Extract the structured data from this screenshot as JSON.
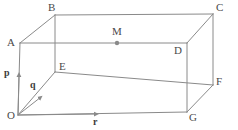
{
  "figure": {
    "shape": "rectangular cuboid in oblique projection",
    "stroke_color": "#8a8a8a",
    "label_color": "#4a4a4a",
    "vector_label_color": "#3c3c3c",
    "background_color": "#ffffff",
    "line_width": 1
  },
  "vertices": [
    {
      "name": "O",
      "label": "O",
      "x": 18,
      "y": 115,
      "label_x": 7,
      "label_y": 110,
      "role": "origin"
    },
    {
      "name": "A",
      "label": "A",
      "x": 20,
      "y": 43,
      "label_x": 7,
      "label_y": 38,
      "role": "top-front-left"
    },
    {
      "name": "B",
      "label": "B",
      "x": 55,
      "y": 15,
      "label_x": 48,
      "label_y": 3,
      "role": "top-back-left"
    },
    {
      "name": "C",
      "label": "C",
      "x": 213,
      "y": 14,
      "label_x": 216,
      "label_y": 3,
      "role": "top-back-right"
    },
    {
      "name": "D",
      "label": "D",
      "x": 187,
      "y": 43,
      "label_x": 175,
      "label_y": 45,
      "role": "top-front-right"
    },
    {
      "name": "E",
      "label": "E",
      "x": 55,
      "y": 72,
      "label_x": 59,
      "label_y": 62,
      "role": "bottom-back-left"
    },
    {
      "name": "F",
      "label": "F",
      "x": 213,
      "y": 85,
      "label_x": 216,
      "label_y": 76,
      "role": "bottom-back-right"
    },
    {
      "name": "G",
      "label": "G",
      "x": 187,
      "y": 112,
      "label_x": 189,
      "label_y": 112,
      "role": "bottom-front-right"
    },
    {
      "name": "M",
      "label": "M",
      "x": 117,
      "y": 43,
      "label_x": 112,
      "label_y": 26,
      "role": "midpoint-of-AD"
    }
  ],
  "marked_point": {
    "name": "M",
    "label": "M",
    "x": 117,
    "y": 43,
    "radius": 2.2,
    "fill": "#8a8a8a",
    "on_edge": "AD"
  },
  "edges": [
    {
      "from": "O",
      "to": "A",
      "style": "solid"
    },
    {
      "from": "A",
      "to": "B",
      "style": "solid"
    },
    {
      "from": "B",
      "to": "C",
      "style": "solid"
    },
    {
      "from": "A",
      "to": "D",
      "style": "solid"
    },
    {
      "from": "C",
      "to": "D",
      "style": "solid"
    },
    {
      "from": "C",
      "to": "F",
      "style": "solid"
    },
    {
      "from": "D",
      "to": "G",
      "style": "solid"
    },
    {
      "from": "B",
      "to": "E",
      "style": "solid"
    },
    {
      "from": "E",
      "to": "F",
      "style": "solid"
    },
    {
      "from": "O",
      "to": "E",
      "style": "solid"
    },
    {
      "from": "O",
      "to": "G",
      "style": "solid"
    },
    {
      "from": "G",
      "to": "F",
      "style": "solid"
    }
  ],
  "vectors": [
    {
      "name": "p",
      "label": "p",
      "from_x": 18,
      "from_y": 115,
      "to_x": 19,
      "to_y": 73,
      "label_x": 5,
      "label_y": 68,
      "direction": "up",
      "along_edge": "OA"
    },
    {
      "name": "q",
      "label": "q",
      "from_x": 18,
      "from_y": 115,
      "to_x": 42,
      "to_y": 96,
      "label_x": 30,
      "label_y": 80,
      "direction": "up-right-diagonal",
      "along_edge": "OE"
    },
    {
      "name": "r",
      "label": "r",
      "from_x": 18,
      "from_y": 115,
      "to_x": 98,
      "to_y": 115,
      "label_x": 93,
      "label_y": 116,
      "direction": "right",
      "along_edge": "OG"
    }
  ]
}
